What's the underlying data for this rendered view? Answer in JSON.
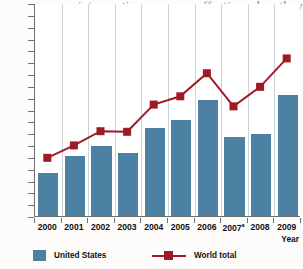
{
  "page_text": {
    "line0": "intervention are more effective when they are co-",
    "line1": "dinated and when the child's uni",
    "line2": "and family circumstances are consi"
  },
  "chart_data": {
    "type": "bar",
    "title": "",
    "xlabel": "Year",
    "ylabel": "",
    "ylim": [
      0,
      1800
    ],
    "ytick_step": 100,
    "grid": false,
    "legend_position": "bottom",
    "categories": [
      "2000",
      "2001",
      "2002",
      "2003",
      "2004",
      "2005",
      "2006",
      "2007",
      "2008",
      "2009"
    ],
    "category_labels": [
      "2000",
      "2001",
      "2002",
      "2003",
      "2004",
      "2005",
      "2006",
      "2007a",
      "2008",
      "2009"
    ],
    "category_footnotes": {
      "2007": "a"
    },
    "ytick_labels": [
      "0",
      "100",
      "200",
      "300",
      "400",
      "500",
      "600",
      "700",
      "800",
      "900",
      "1 000",
      "1 100",
      "1 200",
      "1 300",
      "1 400",
      "1 500",
      "1 600",
      "1 700",
      "1 800"
    ],
    "series": [
      {
        "name": "United States",
        "type": "bar",
        "color": "#4d81a3",
        "values": [
          365,
          505,
          590,
          535,
          740,
          815,
          980,
          670,
          695,
          1025
        ]
      },
      {
        "name": "World total",
        "type": "line",
        "color": "#9e1b26",
        "marker": "square",
        "values": [
          500,
          605,
          725,
          720,
          950,
          1020,
          1215,
          935,
          1100,
          1340
        ]
      }
    ]
  },
  "legend": {
    "items": [
      {
        "label": "United States",
        "color": "#4d81a3",
        "style": "swatch"
      },
      {
        "label": "World total",
        "color": "#9e1b26",
        "style": "line-marker"
      }
    ]
  },
  "axis": {
    "x_title": "Year"
  }
}
